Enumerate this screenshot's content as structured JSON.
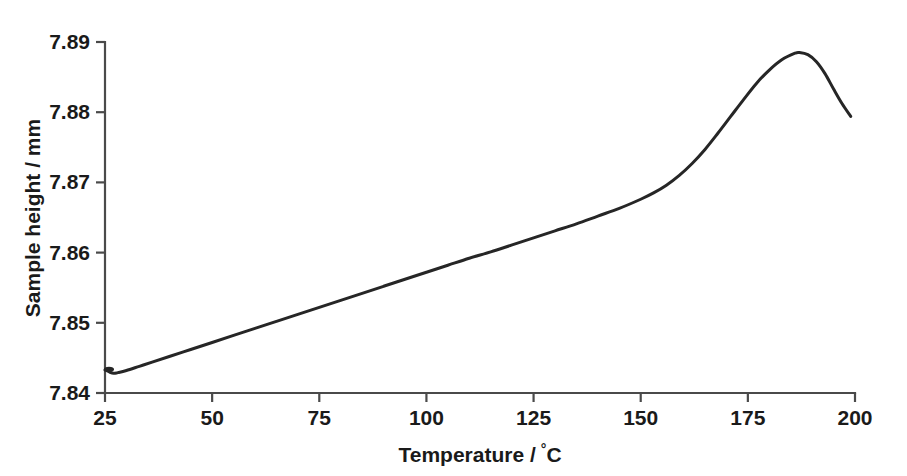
{
  "chart_data": {
    "type": "line",
    "title": "",
    "subtitle": "",
    "xlabel": "Temperature / °C",
    "ylabel": "Sample height / mm",
    "xlabel_main": "Temperature /",
    "xlabel_unit_deg": "°",
    "xlabel_unit_c": "C",
    "xlim": [
      25,
      200
    ],
    "ylim": [
      7.84,
      7.89
    ],
    "xticks": [
      25,
      50,
      75,
      100,
      125,
      150,
      175,
      200
    ],
    "xtick_labels": [
      "25",
      "50",
      "75",
      "100",
      "125",
      "150",
      "175",
      "200"
    ],
    "yticks": [
      7.84,
      7.85,
      7.86,
      7.87,
      7.88,
      7.89
    ],
    "ytick_labels": [
      "7.84",
      "7.85",
      "7.86",
      "7.87",
      "7.88",
      "7.89"
    ],
    "grid": false,
    "legend": false,
    "legend_position": "none",
    "line_color": "#262626",
    "axis_color": "#4a4a4a",
    "background_color": "#ffffff",
    "series": [
      {
        "name": "Sample height",
        "x": [
          25,
          26,
          27,
          28,
          30,
          33,
          36,
          40,
          45,
          50,
          55,
          60,
          65,
          70,
          75,
          80,
          85,
          90,
          95,
          100,
          105,
          110,
          115,
          120,
          125,
          130,
          135,
          140,
          145,
          150,
          153,
          156,
          159,
          162,
          165,
          168,
          171,
          174,
          177,
          180,
          183,
          186,
          187,
          189,
          191,
          193,
          195,
          197,
          199
        ],
        "y": [
          7.8433,
          7.843,
          7.8428,
          7.8429,
          7.8432,
          7.8438,
          7.8444,
          7.8452,
          7.8462,
          7.8472,
          7.8482,
          7.8492,
          7.8502,
          7.8512,
          7.8522,
          7.8532,
          7.8542,
          7.8552,
          7.8562,
          7.8572,
          7.8582,
          7.8592,
          7.8601,
          7.8611,
          7.8621,
          7.8631,
          7.8641,
          7.8652,
          7.8663,
          7.8676,
          7.8685,
          7.8696,
          7.871,
          7.8727,
          7.8747,
          7.877,
          7.8794,
          7.8818,
          7.8841,
          7.886,
          7.8875,
          7.8884,
          7.8885,
          7.8882,
          7.8872,
          7.8855,
          7.8833,
          7.8812,
          7.8794
        ]
      }
    ],
    "peak": {
      "x": 186.5,
      "y": 7.8885
    },
    "start_point": {
      "x": 25,
      "y": 7.8433
    },
    "end_point": {
      "x": 199.3,
      "y": 7.8794
    }
  }
}
